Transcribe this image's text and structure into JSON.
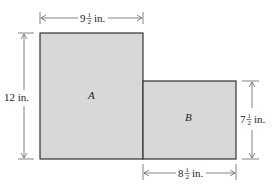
{
  "diagram": {
    "regions": [
      {
        "id": "A",
        "label": "A",
        "fill": "#d9d9d9"
      },
      {
        "id": "B",
        "label": "B",
        "fill": "#d9d9d9"
      }
    ],
    "dimensions": {
      "top_width": {
        "whole": "9",
        "num": "1",
        "den": "2",
        "unit": "in."
      },
      "left_height": {
        "text": "12 in."
      },
      "right_height": {
        "whole": "7",
        "num": "1",
        "den": "2",
        "unit": "in."
      },
      "bottom_width": {
        "whole": "8",
        "num": "1",
        "den": "2",
        "unit": "in."
      }
    }
  }
}
